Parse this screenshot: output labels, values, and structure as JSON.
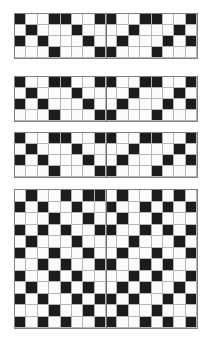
{
  "document": {
    "title": "Chevron Twill Weaving Draft",
    "subtitle": "Four pattern repeats",
    "background_color": "#ffffff"
  },
  "palette": {
    "dark": "#1c1c1c",
    "light": "#fbfbfb",
    "grid_line": "#b5b5b5",
    "panel_border": "#808080",
    "rule_line": "#6e6e6e",
    "panel_background": "#fafafa"
  },
  "chart_data": {
    "type": "heatmap",
    "xlabel": "",
    "ylabel": "",
    "legend": [
      {
        "label": "filled",
        "value": 1,
        "color": "#1c1c1c"
      },
      {
        "label": "blank",
        "value": 0,
        "color": "#fbfbfb"
      }
    ],
    "panels": [
      {
        "name": "panel-1",
        "label": "Repeat 1",
        "columns": 16,
        "rows": 4,
        "cell_px": 11.5,
        "x": 14,
        "y": 13,
        "width": 184,
        "height": 46,
        "rules_v": [
          0.5
        ],
        "rules_h": [],
        "matrix": [
          [
            1,
            0,
            0,
            1,
            1,
            0,
            0,
            1,
            1,
            0,
            0,
            1,
            1,
            0,
            0,
            1
          ],
          [
            0,
            1,
            0,
            0,
            0,
            1,
            0,
            0,
            0,
            0,
            1,
            0,
            0,
            0,
            1,
            0
          ],
          [
            1,
            0,
            1,
            0,
            0,
            0,
            1,
            0,
            0,
            1,
            0,
            0,
            0,
            1,
            0,
            1
          ],
          [
            0,
            0,
            0,
            1,
            0,
            0,
            0,
            1,
            1,
            0,
            0,
            0,
            1,
            0,
            0,
            0
          ]
        ]
      },
      {
        "name": "panel-2",
        "label": "Repeat 2",
        "columns": 16,
        "rows": 4,
        "cell_px": 11.5,
        "x": 14,
        "y": 76,
        "width": 184,
        "height": 46,
        "rules_v": [
          0.5
        ],
        "rules_h": [],
        "matrix": [
          [
            1,
            0,
            0,
            1,
            1,
            0,
            0,
            1,
            1,
            0,
            0,
            1,
            1,
            0,
            0,
            1
          ],
          [
            0,
            1,
            0,
            0,
            0,
            1,
            0,
            0,
            0,
            0,
            1,
            0,
            0,
            0,
            1,
            0
          ],
          [
            1,
            0,
            1,
            0,
            0,
            0,
            1,
            0,
            0,
            1,
            0,
            0,
            0,
            1,
            0,
            1
          ],
          [
            0,
            0,
            0,
            1,
            0,
            0,
            0,
            1,
            1,
            0,
            0,
            0,
            1,
            0,
            0,
            0
          ]
        ]
      },
      {
        "name": "panel-3",
        "label": "Repeat 3",
        "columns": 16,
        "rows": 4,
        "cell_px": 11.5,
        "x": 14,
        "y": 132,
        "width": 184,
        "height": 46,
        "rules_v": [
          0.5
        ],
        "rules_h": [],
        "matrix": [
          [
            1,
            0,
            0,
            1,
            1,
            0,
            0,
            1,
            1,
            0,
            0,
            1,
            1,
            0,
            0,
            1
          ],
          [
            0,
            1,
            0,
            0,
            0,
            1,
            0,
            0,
            0,
            0,
            1,
            0,
            0,
            0,
            1,
            0
          ],
          [
            1,
            0,
            1,
            0,
            0,
            0,
            1,
            0,
            0,
            1,
            0,
            0,
            0,
            1,
            0,
            1
          ],
          [
            0,
            0,
            0,
            1,
            0,
            0,
            0,
            1,
            1,
            0,
            0,
            0,
            1,
            0,
            0,
            0
          ]
        ]
      },
      {
        "name": "panel-4",
        "label": "Repeat 4 (full motif)",
        "columns": 16,
        "rows": 12,
        "cell_px": 11.5,
        "x": 14,
        "y": 189,
        "width": 184,
        "height": 140,
        "rules_v": [
          0.5
        ],
        "rules_h": [],
        "matrix": [
          [
            0,
            1,
            0,
            0,
            1,
            0,
            1,
            1,
            0,
            1,
            0,
            0,
            1,
            0,
            1,
            0
          ],
          [
            1,
            0,
            1,
            0,
            0,
            1,
            0,
            0,
            1,
            0,
            0,
            1,
            0,
            1,
            0,
            1
          ],
          [
            0,
            0,
            0,
            1,
            0,
            0,
            1,
            0,
            0,
            1,
            0,
            0,
            1,
            0,
            0,
            0
          ],
          [
            1,
            0,
            1,
            0,
            1,
            0,
            0,
            1,
            1,
            0,
            0,
            1,
            0,
            1,
            0,
            1
          ],
          [
            0,
            1,
            0,
            0,
            0,
            1,
            0,
            0,
            0,
            0,
            1,
            0,
            0,
            0,
            1,
            0
          ],
          [
            1,
            0,
            0,
            1,
            0,
            0,
            1,
            0,
            0,
            1,
            0,
            0,
            1,
            0,
            0,
            1
          ],
          [
            0,
            0,
            1,
            0,
            1,
            0,
            0,
            1,
            1,
            0,
            0,
            1,
            0,
            1,
            0,
            0
          ],
          [
            1,
            0,
            0,
            1,
            0,
            1,
            0,
            0,
            0,
            0,
            1,
            0,
            1,
            0,
            0,
            1
          ],
          [
            0,
            1,
            0,
            0,
            1,
            0,
            1,
            0,
            0,
            1,
            0,
            1,
            0,
            0,
            1,
            0
          ],
          [
            1,
            0,
            1,
            0,
            0,
            1,
            0,
            1,
            1,
            0,
            1,
            0,
            0,
            1,
            0,
            1
          ],
          [
            0,
            0,
            0,
            1,
            0,
            0,
            1,
            0,
            0,
            1,
            0,
            0,
            1,
            0,
            0,
            0
          ],
          [
            1,
            0,
            1,
            0,
            1,
            0,
            0,
            1,
            1,
            0,
            0,
            1,
            0,
            1,
            0,
            1
          ]
        ]
      }
    ]
  }
}
